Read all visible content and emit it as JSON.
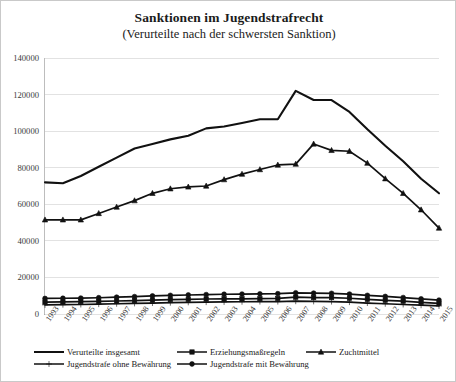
{
  "chart_data": {
    "type": "line",
    "title": "Sanktionen im Jugendstrafrecht",
    "subtitle": "(Verurteilte nach der schwersten Sanktion)",
    "xlabel": "",
    "ylabel": "",
    "ylim": [
      0,
      140000
    ],
    "ytick_step": 20000,
    "yticks": [
      "140000",
      "120000",
      "100000",
      "80000",
      "60000",
      "40000",
      "20000",
      "0"
    ],
    "ytick_values": [
      140000,
      120000,
      100000,
      80000,
      60000,
      40000,
      20000,
      0
    ],
    "grid": true,
    "legend_position": "bottom",
    "categories": [
      "1993",
      "1994",
      "1995",
      "1996",
      "1997",
      "1998",
      "1999",
      "2000",
      "2001",
      "2002",
      "2003",
      "2004",
      "2005",
      "2006",
      "2007",
      "2008",
      "2009",
      "2010",
      "2011",
      "2012",
      "2013",
      "2014",
      "2015"
    ],
    "series": [
      {
        "name": "Verurteilte insgesamt",
        "marker": "none",
        "color": "#111111",
        "values": [
          72000,
          71500,
          75500,
          80500,
          85500,
          90500,
          93000,
          95500,
          97500,
          101500,
          102500,
          104500,
          106500,
          106500,
          122000,
          117000,
          117000,
          110500,
          101000,
          92000,
          83500,
          74000,
          66000
        ]
      },
      {
        "name": "Erziehungsmaßregeln",
        "marker": "square",
        "color": "#111111",
        "values": [
          6500,
          6600,
          6800,
          6900,
          7100,
          7300,
          7600,
          7900,
          8000,
          8200,
          8300,
          8300,
          8400,
          8500,
          9200,
          9000,
          9000,
          8600,
          8000,
          7500,
          7000,
          6400,
          5800
        ]
      },
      {
        "name": "Zuchtmittel",
        "marker": "triangle",
        "color": "#111111",
        "values": [
          51500,
          51500,
          51500,
          55000,
          58500,
          62000,
          66000,
          68500,
          69500,
          70000,
          73500,
          76500,
          79000,
          81500,
          82000,
          93000,
          89500,
          89000,
          82500,
          74000,
          66000,
          57000,
          47000
        ]
      },
      {
        "name": "Jugendstrafe ohne Bewährung",
        "marker": "cross",
        "color": "#111111",
        "values": [
          5000,
          5100,
          5200,
          5400,
          5600,
          5800,
          6000,
          6200,
          6400,
          6500,
          6600,
          6700,
          6800,
          6800,
          7000,
          6900,
          6800,
          6500,
          6000,
          5600,
          5200,
          4800,
          4400
        ]
      },
      {
        "name": "Jugendstrafe mit Bewährung",
        "marker": "circle",
        "color": "#111111",
        "values": [
          8500,
          8600,
          8700,
          8900,
          9200,
          9500,
          9900,
          10200,
          10400,
          10600,
          10800,
          10900,
          11000,
          11100,
          11600,
          11400,
          11300,
          10900,
          10200,
          9600,
          9000,
          8300,
          7600
        ]
      }
    ]
  },
  "legend": {
    "items": [
      {
        "label": "Verurteilte insgesamt",
        "marker": "none"
      },
      {
        "label": "Erziehungsmaßregeln",
        "marker": "square"
      },
      {
        "label": "Zuchtmittel",
        "marker": "triangle"
      },
      {
        "label": "Jugendstrafe ohne Bewährung",
        "marker": "cross"
      },
      {
        "label": "Jugendstrafe mit Bewährung",
        "marker": "circle"
      }
    ]
  }
}
